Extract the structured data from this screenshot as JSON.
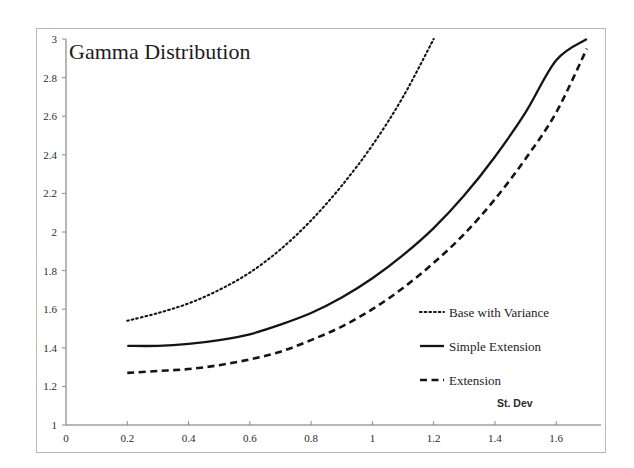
{
  "chart_data": {
    "type": "line",
    "title": "Gamma Distribution",
    "xlabel": "St. Dev",
    "ylabel": "",
    "xlim": [
      0,
      1.72
    ],
    "ylim": [
      1,
      3
    ],
    "grid": false,
    "legend_position": "inside-right",
    "xticks": [
      "0",
      "0.2",
      "0.4",
      "0.6",
      "0.8",
      "1",
      "1.2",
      "1.4",
      "1.6"
    ],
    "xtick_values": [
      0,
      0.2,
      0.4,
      0.6,
      0.8,
      1.0,
      1.2,
      1.4,
      1.6
    ],
    "yticks": [
      "1",
      "1.2",
      "1.4",
      "1.6",
      "1.8",
      "2",
      "2.2",
      "2.4",
      "2.6",
      "2.8",
      "3"
    ],
    "ytick_values": [
      1,
      1.2,
      1.4,
      1.6,
      1.8,
      2.0,
      2.2,
      2.4,
      2.6,
      2.8,
      3.0
    ],
    "x": [
      0.2,
      0.3,
      0.4,
      0.5,
      0.6,
      0.7,
      0.8,
      0.9,
      1.0,
      1.1,
      1.2,
      1.3,
      1.4,
      1.5,
      1.6,
      1.7
    ],
    "series": [
      {
        "name": "Base with Variance",
        "style": "dotted",
        "color": "#141414",
        "values": [
          1.54,
          1.58,
          1.63,
          1.7,
          1.79,
          1.91,
          2.06,
          2.24,
          2.45,
          2.7,
          3.0,
          null,
          null,
          null,
          null,
          null
        ]
      },
      {
        "name": "Simple Extension",
        "style": "solid",
        "color": "#141414",
        "values": [
          1.41,
          1.41,
          1.42,
          1.44,
          1.47,
          1.52,
          1.58,
          1.66,
          1.76,
          1.88,
          2.02,
          2.19,
          2.39,
          2.62,
          2.89,
          3.0
        ]
      },
      {
        "name": "Extension",
        "style": "dashed",
        "color": "#141414",
        "values": [
          1.27,
          1.28,
          1.29,
          1.31,
          1.34,
          1.38,
          1.44,
          1.51,
          1.6,
          1.71,
          1.84,
          1.99,
          2.17,
          2.38,
          2.62,
          2.95
        ]
      }
    ]
  },
  "legend": {
    "items": [
      {
        "label": "Base with Variance",
        "style": "dotted"
      },
      {
        "label": "Simple Extension",
        "style": "solid"
      },
      {
        "label": "Extension",
        "style": "dashed"
      }
    ]
  }
}
